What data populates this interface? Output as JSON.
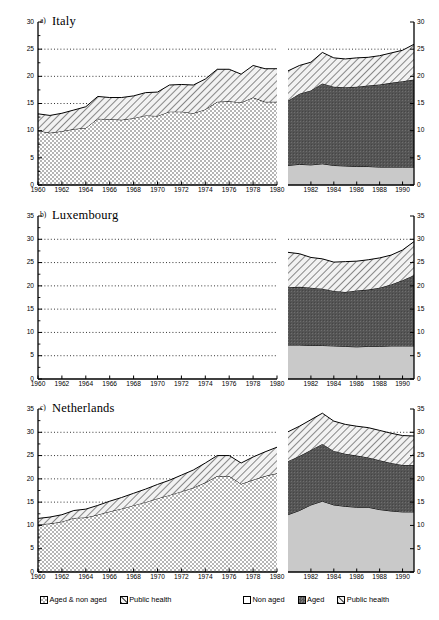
{
  "figure": {
    "panels": [
      {
        "letter": "a)",
        "title": "Italy",
        "ymin": 0,
        "ymax": 30,
        "ystep": 5,
        "yticks": [
          "0",
          "5",
          "10",
          "15",
          "20",
          "25",
          "30"
        ],
        "left_xticks": [
          "1960",
          "1962",
          "1964",
          "1966",
          "1968",
          "1970",
          "1972",
          "1974",
          "1976",
          "1978",
          "1980"
        ],
        "right_xticks": [
          "1982",
          "1984",
          "1986",
          "1988",
          "1990"
        ]
      },
      {
        "letter": "b)",
        "title": "Luxembourg",
        "ymin": 0,
        "ymax": 35,
        "ystep": 5,
        "yticks": [
          "0",
          "5",
          "10",
          "15",
          "20",
          "25",
          "30",
          "35"
        ],
        "left_xticks": [
          "1960",
          "1962",
          "1964",
          "1966",
          "1968",
          "1970",
          "1972",
          "1974",
          "1976",
          "1978",
          "1980"
        ],
        "right_xticks": [
          "1982",
          "1984",
          "1986",
          "1988",
          "1990"
        ]
      },
      {
        "letter": "c)",
        "title": "Netherlands",
        "ymin": 0,
        "ymax": 35,
        "ystep": 5,
        "yticks": [
          "0",
          "5",
          "10",
          "15",
          "20",
          "25",
          "30",
          "35"
        ],
        "left_xticks": [
          "1960",
          "1962",
          "1964",
          "1966",
          "1968",
          "1970",
          "1972",
          "1974",
          "1976",
          "1978",
          "1980"
        ],
        "right_xticks": [
          "1982",
          "1984",
          "1986",
          "1988",
          "1990"
        ]
      }
    ]
  },
  "legend": {
    "left_group": [
      {
        "label": "Aged & non aged",
        "pattern": "checker"
      },
      {
        "label": "Public health",
        "pattern": "hatch"
      }
    ],
    "right_group": [
      {
        "label": "Non aged",
        "pattern": "light"
      },
      {
        "label": "Aged",
        "pattern": "dark"
      },
      {
        "label": "Public health",
        "pattern": "hatch"
      }
    ]
  },
  "colors": {
    "axis": "#000000",
    "grid": "#000000",
    "light": "#c9c9c9",
    "dark": "#555555",
    "checker": "#b5b5b5",
    "hatch": "#dedede"
  },
  "chart_data": {
    "type": "area",
    "xlabel": "",
    "ylabel": "",
    "note": "Three country panels. Each panel has a left sub-plot (1960-1980, two stacked series) and a right sub-plot (1980-1991, three stacked series). Values are cumulative stack tops read off the axis.",
    "panels": [
      {
        "name": "Italy",
        "letter": "a)",
        "ylim": [
          0,
          30
        ],
        "yticks": [
          0,
          5,
          10,
          15,
          20,
          25,
          30
        ],
        "grid": "dotted horizontal at 15, 20, 25",
        "left": {
          "xlim": [
            1960,
            1980
          ],
          "x": [
            1960,
            1961,
            1962,
            1963,
            1964,
            1965,
            1966,
            1967,
            1968,
            1969,
            1970,
            1971,
            1972,
            1973,
            1974,
            1975,
            1976,
            1977,
            1978,
            1979,
            1980
          ],
          "series": [
            {
              "name": "Aged & non aged",
              "pattern": "checker",
              "values": [
                10.0,
                9.6,
                9.9,
                10.3,
                10.5,
                12.2,
                12.1,
                12.0,
                12.3,
                12.8,
                12.7,
                13.5,
                13.5,
                13.2,
                13.9,
                15.3,
                15.4,
                15.2,
                16.1,
                15.3,
                15.3
              ]
            },
            {
              "name": "Public health",
              "pattern": "hatch",
              "values": [
                3.1,
                3.2,
                3.3,
                3.5,
                3.9,
                4.1,
                4.0,
                4.1,
                4.1,
                4.2,
                4.4,
                4.9,
                5.0,
                5.2,
                5.6,
                6.0,
                5.9,
                5.2,
                5.9,
                6.1,
                6.1
              ]
            }
          ],
          "totals": [
            13.1,
            12.8,
            13.2,
            13.8,
            14.4,
            16.3,
            16.1,
            16.1,
            16.4,
            17.0,
            17.1,
            18.4,
            18.5,
            18.4,
            19.5,
            21.3,
            21.3,
            20.4,
            22.0,
            21.4,
            21.4
          ]
        },
        "right": {
          "xlim": [
            1980,
            1991
          ],
          "x": [
            1980,
            1981,
            1982,
            1983,
            1984,
            1985,
            1986,
            1987,
            1988,
            1989,
            1990,
            1991
          ],
          "series": [
            {
              "name": "Non aged",
              "pattern": "light",
              "values": [
                3.6,
                3.8,
                3.7,
                3.9,
                3.6,
                3.5,
                3.4,
                3.4,
                3.3,
                3.3,
                3.3,
                3.3
              ]
            },
            {
              "name": "Aged",
              "pattern": "dark",
              "values": [
                11.9,
                13.0,
                13.7,
                14.8,
                14.5,
                14.5,
                14.7,
                14.9,
                15.2,
                15.5,
                15.8,
                16.1
              ]
            },
            {
              "name": "Public health",
              "pattern": "hatch",
              "values": [
                5.5,
                5.2,
                5.2,
                5.7,
                5.3,
                5.2,
                5.3,
                5.2,
                5.3,
                5.5,
                5.7,
                6.5
              ]
            }
          ],
          "totals": [
            21.0,
            22.0,
            22.6,
            24.4,
            23.4,
            23.2,
            23.4,
            23.5,
            23.8,
            24.3,
            24.8,
            25.9
          ]
        }
      },
      {
        "name": "Luxembourg",
        "letter": "b)",
        "ylim": [
          0,
          35
        ],
        "yticks": [
          0,
          5,
          10,
          15,
          20,
          25,
          30,
          35
        ],
        "grid": "dotted horizontal at 5, 10, 15, 20, 25, 30",
        "left": {
          "xlim": [
            1960,
            1980
          ],
          "x": [],
          "series": [
            {
              "name": "Aged & non aged",
              "pattern": "checker",
              "values": []
            },
            {
              "name": "Public health",
              "pattern": "hatch",
              "values": []
            }
          ],
          "totals": [],
          "note": "no data plotted for 1960-1980"
        },
        "right": {
          "xlim": [
            1980,
            1991
          ],
          "x": [
            1980,
            1981,
            1982,
            1983,
            1984,
            1985,
            1986,
            1987,
            1988,
            1989,
            1990,
            1991
          ],
          "series": [
            {
              "name": "Non aged",
              "pattern": "light",
              "values": [
                7.3,
                7.3,
                7.2,
                7.2,
                7.1,
                7.0,
                6.9,
                7.0,
                7.0,
                7.1,
                7.1,
                7.1
              ]
            },
            {
              "name": "Aged",
              "pattern": "dark",
              "values": [
                12.4,
                12.5,
                12.4,
                12.2,
                11.8,
                11.7,
                12.1,
                12.2,
                12.6,
                13.2,
                14.1,
                15.2
              ]
            },
            {
              "name": "Public health",
              "pattern": "hatch",
              "values": [
                7.5,
                7.1,
                6.5,
                6.4,
                6.2,
                6.5,
                6.3,
                6.4,
                6.4,
                6.3,
                6.5,
                7.2
              ]
            }
          ],
          "totals": [
            27.2,
            26.9,
            26.1,
            25.8,
            25.1,
            25.2,
            25.3,
            25.6,
            26.0,
            26.6,
            27.7,
            29.5
          ]
        }
      },
      {
        "name": "Netherlands",
        "letter": "c)",
        "ylim": [
          0,
          35
        ],
        "yticks": [
          0,
          5,
          10,
          15,
          20,
          25,
          30,
          35
        ],
        "grid": "dotted horizontal at 15, 20, 25, 30",
        "left": {
          "xlim": [
            1960,
            1980
          ],
          "x": [
            1960,
            1961,
            1962,
            1963,
            1964,
            1965,
            1966,
            1967,
            1968,
            1969,
            1970,
            1971,
            1972,
            1973,
            1974,
            1975,
            1976,
            1977,
            1978,
            1979,
            1980
          ],
          "series": [
            {
              "name": "Aged & non aged",
              "pattern": "checker",
              "values": [
                10.2,
                10.4,
                10.8,
                11.6,
                11.7,
                12.3,
                13.0,
                13.6,
                14.3,
                15.0,
                15.8,
                16.5,
                17.3,
                18.1,
                19.2,
                20.6,
                20.6,
                18.9,
                19.8,
                20.6,
                21.2
              ]
            },
            {
              "name": "Public health",
              "pattern": "hatch",
              "values": [
                1.3,
                1.4,
                1.5,
                1.6,
                1.8,
                2.0,
                2.2,
                2.4,
                2.6,
                2.8,
                3.0,
                3.2,
                3.5,
                3.8,
                4.2,
                4.4,
                4.4,
                4.5,
                4.9,
                5.2,
                5.6
              ]
            }
          ],
          "totals": [
            11.5,
            11.8,
            12.3,
            13.2,
            13.5,
            14.3,
            15.2,
            16.0,
            16.9,
            17.8,
            18.8,
            19.7,
            20.8,
            21.9,
            23.4,
            25.0,
            25.0,
            23.4,
            24.7,
            25.8,
            26.8
          ]
        },
        "right": {
          "xlim": [
            1980,
            1991
          ],
          "x": [
            1980,
            1981,
            1982,
            1983,
            1984,
            1985,
            1986,
            1987,
            1988,
            1989,
            1990,
            1991
          ],
          "series": [
            {
              "name": "Non aged",
              "pattern": "light",
              "values": [
                12.3,
                13.2,
                14.4,
                15.2,
                14.4,
                14.1,
                13.9,
                13.9,
                13.4,
                13.1,
                12.9,
                12.9
              ]
            },
            {
              "name": "Aged",
              "pattern": "dark",
              "values": [
                11.5,
                11.7,
                11.8,
                12.3,
                11.6,
                11.3,
                11.1,
                10.7,
                10.6,
                10.3,
                10.1,
                10.1
              ]
            },
            {
              "name": "Public health",
              "pattern": "hatch",
              "values": [
                6.3,
                6.4,
                6.5,
                6.6,
                6.4,
                6.3,
                6.3,
                6.4,
                6.4,
                6.4,
                6.3,
                6.2
              ]
            }
          ],
          "totals": [
            30.1,
            31.3,
            32.7,
            34.1,
            32.4,
            31.7,
            31.3,
            31.0,
            30.4,
            29.8,
            29.3,
            29.2
          ]
        }
      }
    ]
  }
}
